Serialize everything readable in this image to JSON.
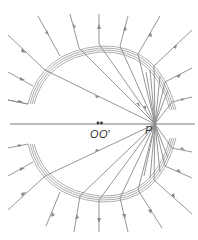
{
  "diagram": {
    "type": "field-lines",
    "labels": {
      "origin": "O",
      "origin_prime": "O′",
      "point": "P"
    },
    "colors": {
      "lines": "#8a8a8a",
      "text": "#333333",
      "background": "#ffffff"
    }
  }
}
